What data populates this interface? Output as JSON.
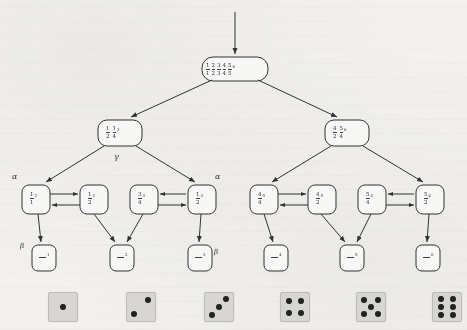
{
  "figure": {
    "type": "probabilistic-tree-diagram",
    "background_color": "#f2f1ef",
    "ink_color": "#2b2b2b",
    "die_face_color": "#d9d8d5",
    "pip_color": "#1a1a1a"
  },
  "nodes": {
    "root": {
      "id": "root",
      "label": "1/1 2/1 3/1 4/1 5/1",
      "fractions": [
        {
          "num": "1",
          "den": "1"
        },
        {
          "num": "2",
          "den": "2"
        },
        {
          "num": "3",
          "den": "3"
        },
        {
          "num": "4",
          "den": "4"
        },
        {
          "num": "5",
          "den": "5"
        }
      ],
      "superscript": "6",
      "x": 202,
      "y": 57,
      "w": 66,
      "h": 24
    },
    "level2": [
      {
        "id": "l2-left",
        "fractions": [
          {
            "num": "1",
            "den": "2"
          },
          {
            "num": "1",
            "den": "4"
          }
        ],
        "superscript": "3",
        "x": 98,
        "y": 120,
        "w": 44,
        "h": 26
      },
      {
        "id": "l2-right",
        "fractions": [
          {
            "num": "4",
            "den": "2"
          },
          {
            "num": "5",
            "den": "4"
          }
        ],
        "superscript": "6",
        "x": 325,
        "y": 120,
        "w": 44,
        "h": 26
      }
    ],
    "level3": [
      {
        "id": "l3-1",
        "num": "1",
        "den": "1",
        "superscript": "2",
        "x": 22,
        "y": 185,
        "w": 28,
        "h": 29
      },
      {
        "id": "l3-2",
        "num": "1",
        "den": "2",
        "superscript": "2",
        "x": 80,
        "y": 185,
        "w": 28,
        "h": 29
      },
      {
        "id": "l3-3",
        "num": "3",
        "den": "4",
        "superscript": "3",
        "x": 130,
        "y": 185,
        "w": 28,
        "h": 29
      },
      {
        "id": "l3-4",
        "num": "1",
        "den": "2",
        "superscript": "3",
        "x": 188,
        "y": 185,
        "w": 28,
        "h": 29
      },
      {
        "id": "l3-5",
        "num": "4",
        "den": "4",
        "superscript": "5",
        "x": 250,
        "y": 185,
        "w": 28,
        "h": 29
      },
      {
        "id": "l3-6",
        "num": "4",
        "den": "2",
        "superscript": "5",
        "x": 308,
        "y": 185,
        "w": 28,
        "h": 29
      },
      {
        "id": "l3-7",
        "num": "5",
        "den": "4",
        "superscript": "6",
        "x": 358,
        "y": 185,
        "w": 28,
        "h": 29
      },
      {
        "id": "l3-8",
        "num": "5",
        "den": "2",
        "superscript": "6",
        "x": 416,
        "y": 185,
        "w": 28,
        "h": 29
      }
    ],
    "leaves": [
      {
        "id": "leaf-1",
        "superscript": "1",
        "x": 32,
        "y": 245,
        "w": 24,
        "h": 26
      },
      {
        "id": "leaf-2",
        "superscript": "2",
        "x": 110,
        "y": 245,
        "w": 24,
        "h": 26
      },
      {
        "id": "leaf-3",
        "superscript": "3",
        "x": 188,
        "y": 245,
        "w": 24,
        "h": 26
      },
      {
        "id": "leaf-4",
        "superscript": "4",
        "x": 264,
        "y": 245,
        "w": 24,
        "h": 26
      },
      {
        "id": "leaf-5",
        "superscript": "5",
        "x": 340,
        "y": 245,
        "w": 24,
        "h": 26
      },
      {
        "id": "leaf-6",
        "superscript": "6",
        "x": 416,
        "y": 245,
        "w": 24,
        "h": 26
      }
    ]
  },
  "greek_labels": [
    {
      "id": "gamma-1",
      "symbol": "γ",
      "x": 114,
      "y": 152
    },
    {
      "id": "alpha-left",
      "symbol": "α",
      "x": 12,
      "y": 172
    },
    {
      "id": "alpha-right",
      "symbol": "α",
      "x": 215,
      "y": 172
    },
    {
      "id": "beta-left",
      "symbol": "β",
      "x": 20,
      "y": 242
    },
    {
      "id": "beta-right",
      "symbol": "β",
      "x": 214,
      "y": 248
    }
  ],
  "dice": [
    {
      "id": "die-1",
      "pips": 1,
      "x": 48,
      "y": 292,
      "size": 28
    },
    {
      "id": "die-2",
      "pips": 2,
      "x": 126,
      "y": 292,
      "size": 28
    },
    {
      "id": "die-3",
      "pips": 3,
      "x": 204,
      "y": 292,
      "size": 28
    },
    {
      "id": "die-4",
      "pips": 4,
      "x": 280,
      "y": 292,
      "size": 28
    },
    {
      "id": "die-5",
      "pips": 5,
      "x": 356,
      "y": 292,
      "size": 28
    },
    {
      "id": "die-6",
      "pips": 6,
      "x": 432,
      "y": 292,
      "size": 28
    }
  ],
  "edges": {
    "incoming_root": {
      "from_y": 10,
      "to_y": 55,
      "x": 235
    },
    "tree_edges": 14,
    "bidirectional_pairs": 4
  }
}
